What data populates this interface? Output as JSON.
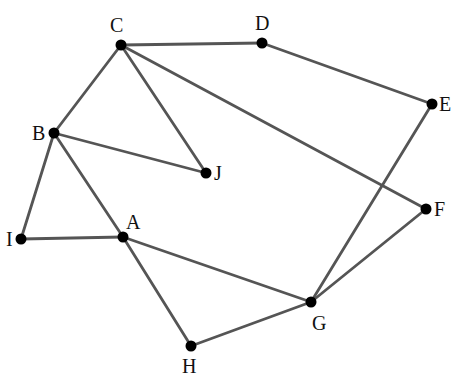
{
  "diagram": {
    "type": "undirected-graph",
    "colors": {
      "edge": "#555555",
      "node": "#000000",
      "label": "#111111",
      "background": "#ffffff"
    },
    "nodes": [
      {
        "id": "A",
        "label": "A",
        "x": 123,
        "y": 237,
        "lx": 126,
        "ly": 229,
        "anchor": "start"
      },
      {
        "id": "B",
        "label": "B",
        "x": 54,
        "y": 133,
        "lx": 32,
        "ly": 140,
        "anchor": "start"
      },
      {
        "id": "C",
        "label": "C",
        "x": 121,
        "y": 45,
        "lx": 110,
        "ly": 32,
        "anchor": "start"
      },
      {
        "id": "D",
        "label": "D",
        "x": 262,
        "y": 43,
        "lx": 255,
        "ly": 30,
        "anchor": "start"
      },
      {
        "id": "E",
        "label": "E",
        "x": 432,
        "y": 104,
        "lx": 439,
        "ly": 111,
        "anchor": "start"
      },
      {
        "id": "F",
        "label": "F",
        "x": 426,
        "y": 209,
        "lx": 434,
        "ly": 216,
        "anchor": "start"
      },
      {
        "id": "G",
        "label": "G",
        "x": 311,
        "y": 302,
        "lx": 312,
        "ly": 330,
        "anchor": "start"
      },
      {
        "id": "H",
        "label": "H",
        "x": 191,
        "y": 346,
        "lx": 182,
        "ly": 373,
        "anchor": "start"
      },
      {
        "id": "I",
        "label": "I",
        "x": 21,
        "y": 239,
        "lx": 6,
        "ly": 246,
        "anchor": "start"
      },
      {
        "id": "J",
        "label": "J",
        "x": 206,
        "y": 173,
        "lx": 214,
        "ly": 180,
        "anchor": "start"
      }
    ],
    "edges": [
      [
        "C",
        "D"
      ],
      [
        "D",
        "E"
      ],
      [
        "C",
        "B"
      ],
      [
        "C",
        "J"
      ],
      [
        "C",
        "F"
      ],
      [
        "B",
        "J"
      ],
      [
        "B",
        "I"
      ],
      [
        "B",
        "A"
      ],
      [
        "I",
        "A"
      ],
      [
        "A",
        "G"
      ],
      [
        "A",
        "H"
      ],
      [
        "H",
        "G"
      ],
      [
        "G",
        "E"
      ],
      [
        "G",
        "F"
      ]
    ]
  }
}
